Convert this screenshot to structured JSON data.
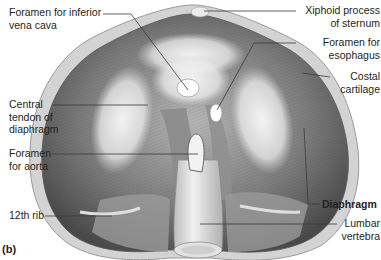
{
  "figure": {
    "panel_label": "(b)",
    "colors": {
      "background": "#ffffff",
      "muscle_dark": "#5a5a5a",
      "muscle_mid": "#8c8c8c",
      "tendon_light": "#eeeeee",
      "cartilage": "#cfcfcf",
      "leader_line": "#3a3a3a",
      "text": "#231f20"
    }
  },
  "labels": {
    "ivc_line1": "Foramen for inferior",
    "ivc_line2": "vena cava",
    "central_line1": "Central",
    "central_line2": "tendon of",
    "central_line3": "diaphragm",
    "aorta_line1": "Foramen",
    "aorta_line2": "for aorta",
    "rib12": "12th rib",
    "xiphoid_line1": "Xiphoid process",
    "xiphoid_line2": "of sternum",
    "esoph_line1": "Foramen for",
    "esoph_line2": "esophagus",
    "costal_line1": "Costal",
    "costal_line2": "cartilage",
    "diaphragm": "Diaphragm",
    "lumbar_line1": "Lumbar",
    "lumbar_line2": "vertebra"
  }
}
